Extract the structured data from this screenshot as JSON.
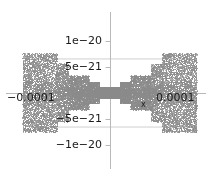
{
  "figure": {
    "background": "#ffffff",
    "axis_color": "#b9b9b9",
    "envelope_color": "#cfcfcf",
    "data_color": "#8a8a8a",
    "text_color": "#1a1a1a"
  },
  "axis_titles": {
    "x": "x",
    "y": ""
  },
  "y_ticks": [
    {
      "label": "1e−20",
      "value": 1e-20,
      "py": 41
    },
    {
      "label": "5e−21",
      "value": 5e-21,
      "py": 67
    },
    {
      "label": "−5e−21",
      "value": -5e-21,
      "py": 119
    },
    {
      "label": "−1e−20",
      "value": -1e-20,
      "py": 145
    }
  ],
  "x_ticks": [
    {
      "label": "−0.0001",
      "value": -0.0001,
      "px": 40
    },
    {
      "label": "0.0001",
      "value": 0.0001,
      "px": 177
    }
  ],
  "chart_data": {
    "type": "scatter",
    "title": "",
    "subtitle": "",
    "xlabel": "x",
    "ylabel": "",
    "xlim": [
      -0.00013,
      0.00013
    ],
    "ylim": [
      -1.5e-20,
      1.5e-20
    ],
    "x_tick_labels": [
      "−0.0001",
      "0.0001"
    ],
    "x_tick_values": [
      -0.0001,
      0.0001
    ],
    "y_tick_labels": [
      "1e−20",
      "5e−21",
      "−5e−21",
      "−1e−20"
    ],
    "y_tick_values": [
      1e-20,
      5e-21,
      -5e-21,
      -1e-20
    ],
    "grid": false,
    "legend": null,
    "legend_position": "none",
    "annotations": [
      {
        "text": "envelope",
        "type": "line",
        "slope": 5.55e-17,
        "note": "upper diagonal y = +eps*|x|"
      },
      {
        "text": "envelope",
        "type": "line",
        "slope": -5.55e-17,
        "note": "lower diagonal y = -eps*|x|"
      }
    ],
    "series": [
      {
        "name": "rounding error",
        "marker": "point",
        "color": "#8a8a8a",
        "n_points": 9000,
        "envelope_slope": 5.55e-17,
        "binade_steps": [
          {
            "x_start": 0.0,
            "x_end": 1.55e-05,
            "half_amplitude": 1.1e-21
          },
          {
            "x_start": 1.55e-05,
            "x_end": 3.1e-05,
            "half_amplitude": 2.1e-21
          },
          {
            "x_start": 3.1e-05,
            "x_end": 6.2e-05,
            "half_amplitude": 3.3e-21
          },
          {
            "x_start": 6.2e-05,
            "x_end": 7.8e-05,
            "half_amplitude": 5.6e-21
          },
          {
            "x_start": 7.8e-05,
            "x_end": 0.00013,
            "half_amplitude": 7.6e-21
          }
        ]
      }
    ]
  }
}
